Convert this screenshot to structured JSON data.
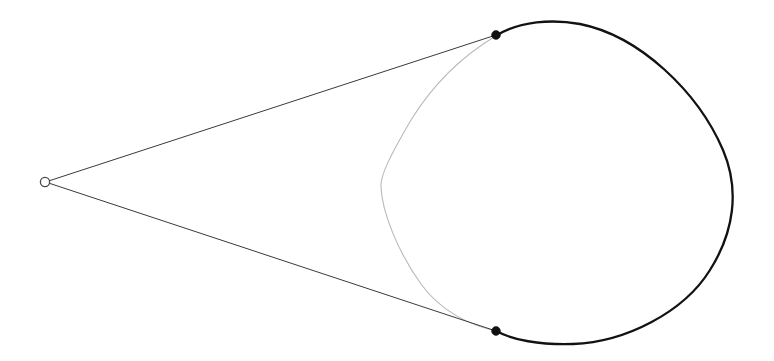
{
  "canvas": {
    "width": 774,
    "height": 361,
    "background": "#ffffff",
    "title": "Tangent lines from an external point to a circle"
  },
  "colors": {
    "far_arc": "#121212",
    "near_arc": "#b9b9b9",
    "tangent_line": "#3a3a3a",
    "vertex_stroke": "#4a4a4a",
    "vertex_fill": "#ffffff",
    "tangent_point_fill": "#111111",
    "background": "#ffffff"
  },
  "strokes": {
    "far_arc_width": "2.3",
    "near_arc_width": "1.1",
    "tangent_line_width": "1.0",
    "vertex_width": "1.3"
  },
  "chart_data": {
    "type": "scatter",
    "title": "Tangent lines from an external point to a circle",
    "xlabel": "",
    "ylabel": "",
    "xlim": [
      0,
      774
    ],
    "ylim": [
      361,
      0
    ],
    "grid": false,
    "legend": "none",
    "annotations": [],
    "points": [
      {
        "name": "apex",
        "label": "",
        "x": 45,
        "y": 182,
        "marker": "open-circle",
        "radius": 4.6
      },
      {
        "name": "tangent-point-upper",
        "label": "",
        "x": 496,
        "y": 35,
        "marker": "filled-circle",
        "radius": 4.4
      },
      {
        "name": "tangent-point-lower",
        "label": "",
        "x": 496,
        "y": 331,
        "marker": "filled-circle",
        "radius": 4.4
      }
    ],
    "series": [
      {
        "name": "upper-tangent-line",
        "type": "line",
        "x": [
          45,
          496
        ],
        "y": [
          182,
          35
        ],
        "color": "#3a3a3a",
        "width": 1.0
      },
      {
        "name": "lower-tangent-line",
        "type": "line",
        "x": [
          45,
          496
        ],
        "y": [
          182,
          331
        ],
        "color": "#3a3a3a",
        "width": 1.0
      },
      {
        "name": "far-arc",
        "type": "arc",
        "center": [
          553,
          183
        ],
        "rx": 182,
        "ry": 161,
        "start_point": [
          496,
          35
        ],
        "end_point": [
          496,
          331
        ],
        "sweep": "clockwise-right",
        "color": "#121212",
        "width": 2.3
      },
      {
        "name": "near-arc",
        "type": "arc",
        "center": [
          553,
          183
        ],
        "rx": 172,
        "ry": 152,
        "start_point": [
          496,
          35
        ],
        "end_point": [
          496,
          331
        ],
        "bulge_x": 381,
        "sweep": "counterclockwise-left",
        "color": "#b9b9b9",
        "width": 1.1
      }
    ]
  },
  "geometry": {
    "apex": {
      "x": 45,
      "y": 182,
      "radius": 4.6
    },
    "upper_tangent_point": {
      "x": 496,
      "y": 35,
      "radius": 4.4
    },
    "lower_tangent_point": {
      "x": 496,
      "y": 331,
      "radius": 4.4
    },
    "far_arc_path": "M 496.5 35.5 C 520 21 552 19 580 24 C 640 36 698 92 723 150 C 740 190 734 232 710 270 C 684 312 626 342 573 344 C 540 345 512 340 496.5 331",
    "near_arc_path": "M 496.5 35.5 C 462 56 432 86 411 120 C 390 156 380 176 381 187 C 382 212 398 252 421 284 C 441 312 472 326 496.5 331",
    "upper_line_path": "M 45.5 182 L 496 35",
    "lower_line_path": "M 45.5 182 L 496 331"
  }
}
